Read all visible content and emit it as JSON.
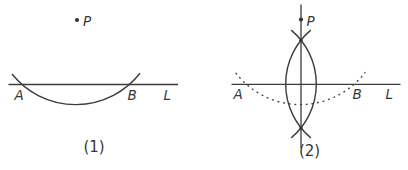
{
  "figure": {
    "panels": [
      {
        "caption": "(1)",
        "labels": {
          "p": "P",
          "a": "A",
          "b": "B",
          "l": "L"
        }
      },
      {
        "caption": "(2)",
        "labels": {
          "p": "P",
          "a": "A",
          "b": "B",
          "l": "L"
        }
      }
    ]
  },
  "colors": {
    "ink": "#3c3c3c",
    "background": "#ffffff"
  }
}
